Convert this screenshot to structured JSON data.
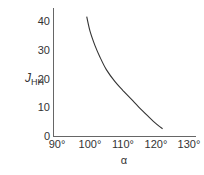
{
  "chart_data": {
    "type": "line",
    "title": "",
    "xlabel": "α",
    "ylabel": "J",
    "ylabel_subscript": "HH",
    "xlim": [
      90,
      132
    ],
    "ylim": [
      0,
      43
    ],
    "x_ticks": [
      90,
      100,
      110,
      120,
      130
    ],
    "x_tick_labels": [
      "90°",
      "100°",
      "110°",
      "120°",
      "130°"
    ],
    "y_ticks": [
      0,
      10,
      20,
      30,
      40
    ],
    "y_tick_labels": [
      "0",
      "10",
      "20",
      "30",
      "40"
    ],
    "grid": false,
    "legend": null,
    "series": [
      {
        "name": "J_HH vs α",
        "x": [
          99.0,
          100.0,
          101.5,
          103.0,
          105.0,
          107.5,
          110.0,
          112.5,
          115.0,
          117.5,
          120.0,
          122.0
        ],
        "y": [
          41.5,
          36.5,
          31.5,
          27.5,
          23.0,
          19.0,
          15.8,
          12.8,
          9.8,
          7.0,
          4.3,
          2.5
        ]
      }
    ],
    "color": "#333333"
  }
}
